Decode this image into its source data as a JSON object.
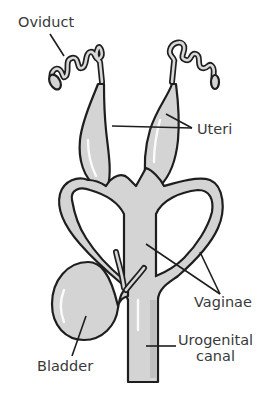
{
  "diagram": {
    "type": "anatomical-illustration",
    "colors": {
      "organ_fill": "#d4d4d4",
      "outline": "#1e1e1e",
      "label_text": "#3a3a3a",
      "background": "#ffffff"
    },
    "labels": {
      "oviduct": "Oviduct",
      "uteri": "Uteri",
      "vaginae": "Vaginae",
      "urogenital_line1": "Urogenital",
      "urogenital_line2": "canal",
      "bladder": "Bladder"
    }
  }
}
